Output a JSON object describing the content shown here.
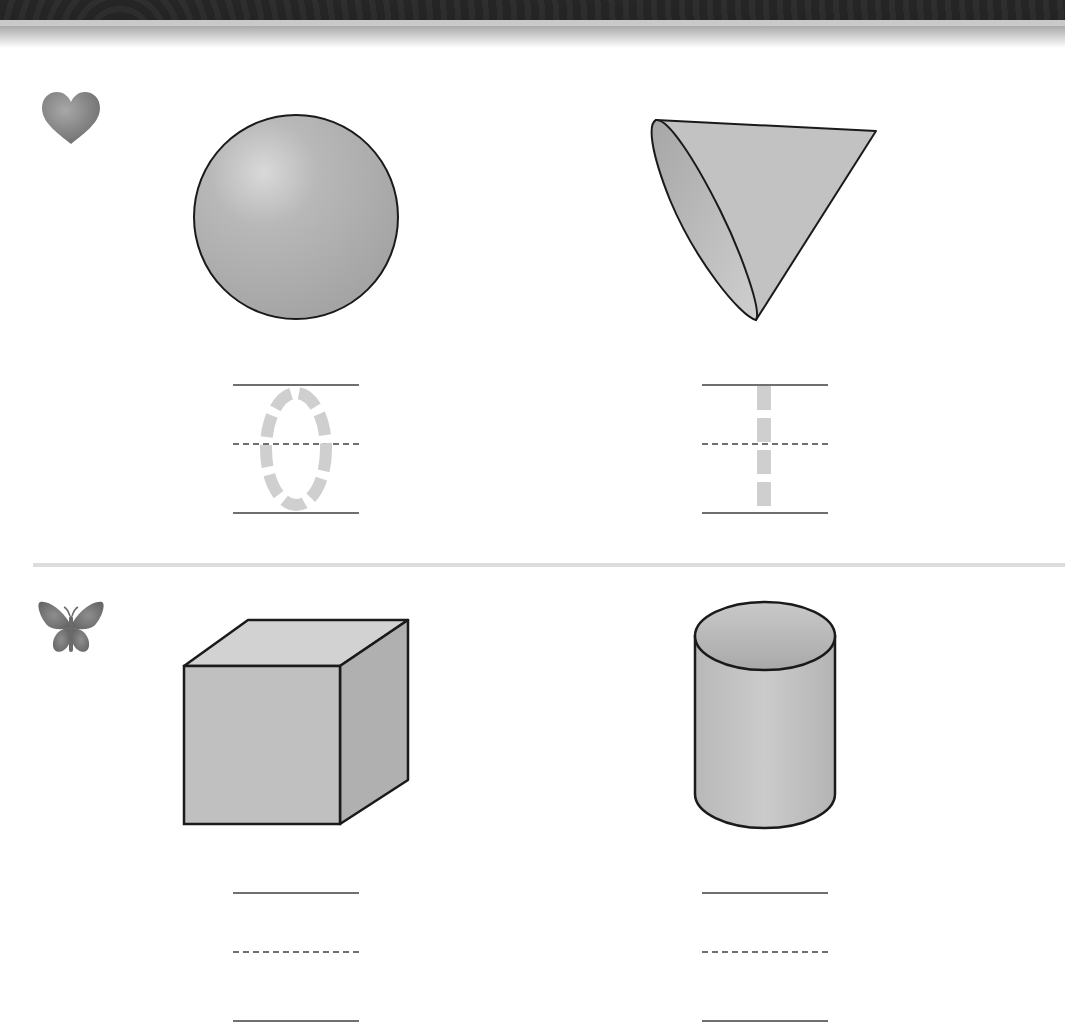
{
  "worksheet": {
    "header": {
      "style": "decorative-swirl-band"
    },
    "colors": {
      "band": "#8a8a8a",
      "shape_fill": "#b5b5b5",
      "shape_outline": "#1a1a1a",
      "trace_dash": "#cfcfcf",
      "guide_line": "#6f6f6f",
      "divider": "#dcdcdc"
    },
    "rows": [
      {
        "marker_icon": "heart-icon",
        "items": [
          {
            "shape": "sphere",
            "trace_digit": "0"
          },
          {
            "shape": "cone",
            "trace_digit": "1"
          }
        ]
      },
      {
        "marker_icon": "butterfly-icon",
        "items": [
          {
            "shape": "cube",
            "trace_digit": ""
          },
          {
            "shape": "cylinder",
            "trace_digit": ""
          }
        ]
      }
    ]
  }
}
